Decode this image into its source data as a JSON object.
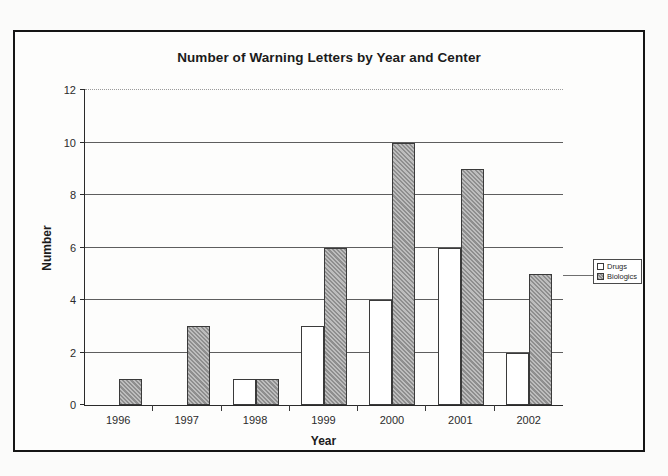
{
  "chart_data": {
    "type": "bar",
    "title": "Number of Warning Letters by Year and Center",
    "xlabel": "Year",
    "ylabel": "Number",
    "categories": [
      "1996",
      "1997",
      "1998",
      "1999",
      "2000",
      "2001",
      "2002"
    ],
    "series": [
      {
        "name": "Drugs",
        "values": [
          0,
          0,
          1,
          3,
          4,
          6,
          2
        ]
      },
      {
        "name": "Biologics",
        "values": [
          1,
          3,
          1,
          6,
          10,
          9,
          5
        ]
      }
    ],
    "ylim": [
      0,
      12
    ],
    "yticks": [
      0,
      2,
      4,
      6,
      8,
      10,
      12
    ],
    "grid": true,
    "legend_position": "right",
    "colors": {
      "drugs": "#ffffff",
      "biologics": "#a2a2a2",
      "axis": "#2a2a2a",
      "gridline": "#5e5e5e",
      "frame": "#151515",
      "text": "#1b1b1b"
    }
  },
  "legend": {
    "items": [
      {
        "label": "Drugs"
      },
      {
        "label": "Biologics"
      }
    ]
  }
}
